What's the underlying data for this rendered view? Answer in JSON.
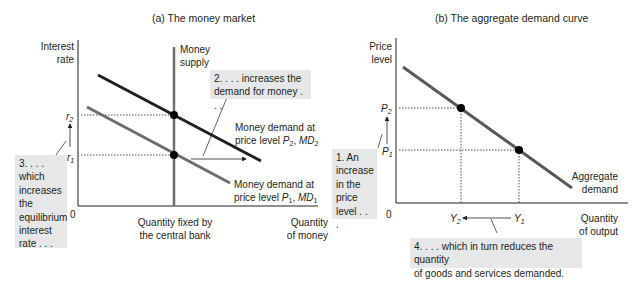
{
  "panel_a": {
    "title": "(a) The money market",
    "y_axis_label_1": "Interest",
    "y_axis_label_2": "rate",
    "x_axis_label_1": "Quantity",
    "x_axis_label_2": "of money",
    "origin": "0",
    "supply_label_1": "Money",
    "supply_label_2": "supply",
    "fixed_label_1": "Quantity fixed by",
    "fixed_label_2": "the central bank",
    "r2": "r",
    "r2_sub": "2",
    "r1": "r",
    "r1_sub": "1",
    "md2_label_1": "Money demand at",
    "md2_label_2_prefix": "price level ",
    "md2_P": "P",
    "md2_P_sub": "2",
    "md2_MD": "MD",
    "md2_MD_sub": "2",
    "md1_label_1": "Money demand at",
    "md1_label_2_prefix": "price level ",
    "md1_P": "P",
    "md1_P_sub": "1",
    "md1_MD": "MD",
    "md1_MD_sub": "1",
    "note_2_line1": "2. . . . increases the",
    "note_2_line2": "demand for money . . .",
    "note_3_lines": [
      "3. . . .",
      "which",
      "increases",
      "the",
      "equilibrium",
      "interest",
      "rate . . ."
    ]
  },
  "panel_b": {
    "title": "(b) The aggregate demand curve",
    "y_axis_label_1": "Price",
    "y_axis_label_2": "level",
    "x_axis_label_1": "Quantity",
    "x_axis_label_2": "of output",
    "origin": "0",
    "p2": "P",
    "p2_sub": "2",
    "p1": "P",
    "p1_sub": "1",
    "y2": "Y",
    "y2_sub": "2",
    "y1": "Y",
    "y1_sub": "1",
    "curve_label_1": "Aggregate",
    "curve_label_2": "demand",
    "note_1_lines": [
      "1. An",
      "increase",
      "in the",
      "price",
      "level . . ."
    ],
    "note_4_line1": "4. . . . which in turn reduces the quantity",
    "note_4_line2": "of goods and services demanded."
  },
  "colors": {
    "md2_line": "#231f20",
    "md1_line": "#6d6e71",
    "supply_line": "#6d6e71",
    "ad_line": "#58595b",
    "note_bg": "#e6e7e8"
  }
}
